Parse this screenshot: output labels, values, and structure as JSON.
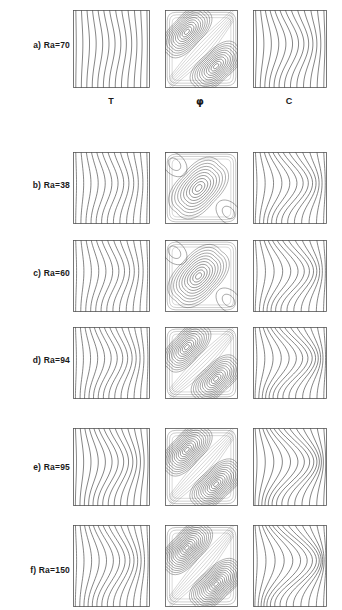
{
  "figure": {
    "width": 342,
    "height": 610,
    "line_color": "#3a3a3a",
    "frame_color": "#555555",
    "background": "#ffffff"
  },
  "columns": [
    {
      "key": "T",
      "label": "T",
      "name": "temperature",
      "x": 73,
      "width": 77,
      "header_center": 111
    },
    {
      "key": "PHI",
      "label": "φ",
      "name": "streamfunction",
      "x": 165,
      "width": 73,
      "header_center": 200
    },
    {
      "key": "C",
      "label": "C",
      "name": "concentration",
      "x": 253,
      "width": 74,
      "header_center": 289
    }
  ],
  "column_headers_y": 96,
  "rows": [
    {
      "id": "a",
      "label": "a) Ra=70",
      "ra": 70,
      "y": 10,
      "height": 78,
      "label_y": 40,
      "T": {
        "n": 13,
        "amp": 0.03,
        "phase": 1,
        "mode": 1
      },
      "PHI": {
        "cells": 2,
        "levels": 11,
        "tilt": 1,
        "strength": 0.88,
        "shaded": true
      },
      "C": {
        "n": 13,
        "amp": 0.075,
        "phase": 1,
        "mode": 1
      }
    },
    {
      "id": "b",
      "label": "b) Ra=38",
      "ra": 38,
      "y": 152,
      "height": 72,
      "label_y": 180,
      "T": {
        "n": 13,
        "amp": 0.055,
        "phase": 1,
        "mode": 1
      },
      "PHI": {
        "cells": 1,
        "levels": 10,
        "tilt": 1,
        "strength": 0.55,
        "shaded": false
      },
      "C": {
        "n": 13,
        "amp": 0.115,
        "phase": 1,
        "mode": 1
      }
    },
    {
      "id": "c",
      "label": "c) Ra=60",
      "ra": 60,
      "y": 240,
      "height": 72,
      "label_y": 268,
      "T": {
        "n": 13,
        "amp": 0.062,
        "phase": 1,
        "mode": 1
      },
      "PHI": {
        "cells": 1,
        "levels": 11,
        "tilt": 1,
        "strength": 0.65,
        "shaded": false
      },
      "C": {
        "n": 13,
        "amp": 0.125,
        "phase": 1,
        "mode": 1
      }
    },
    {
      "id": "d",
      "label": "d) Ra=94",
      "ra": 94,
      "y": 327,
      "height": 72,
      "label_y": 355,
      "T": {
        "n": 14,
        "amp": 0.072,
        "phase": 1,
        "mode": 1
      },
      "PHI": {
        "cells": 2,
        "levels": 11,
        "tilt": 1,
        "strength": 0.75,
        "shaded": true
      },
      "C": {
        "n": 14,
        "amp": 0.135,
        "phase": 1,
        "mode": 1
      }
    },
    {
      "id": "e",
      "label": "e) Ra=95",
      "ra": 95,
      "y": 428,
      "height": 78,
      "label_y": 462,
      "T": {
        "n": 14,
        "amp": 0.08,
        "phase": 1,
        "mode": 1
      },
      "PHI": {
        "cells": 2,
        "levels": 12,
        "tilt": 1,
        "strength": 0.92,
        "shaded": true
      },
      "C": {
        "n": 14,
        "amp": 0.15,
        "phase": 1,
        "mode": 1
      }
    },
    {
      "id": "f",
      "label": "f) Ra=150",
      "ra": 150,
      "y": 525,
      "height": 82,
      "label_y": 565,
      "T": {
        "n": 14,
        "amp": 0.092,
        "phase": 1,
        "mode": 1
      },
      "PHI": {
        "cells": 2,
        "levels": 13,
        "tilt": 1,
        "strength": 1.0,
        "shaded": true
      },
      "C": {
        "n": 14,
        "amp": 0.175,
        "phase": 1,
        "mode": 1
      }
    }
  ],
  "chart_data": {
    "type": "contour_grid",
    "xlabel": "",
    "ylabel": "",
    "grid": false,
    "legend": "none",
    "row_variable": "Ra",
    "row_values": [
      70,
      38,
      60,
      94,
      95,
      150
    ],
    "row_labels": [
      "a) Ra=70",
      "b) Ra=38",
      "c) Ra=60",
      "d) Ra=94",
      "e) Ra=95",
      "f) Ra=150"
    ],
    "column_variables": [
      "T",
      "φ",
      "C"
    ],
    "column_labels": [
      "T",
      "φ",
      "C"
    ],
    "series": [
      {
        "name": "T",
        "description": "Near-vertical isotherms; waviness increases with Ra",
        "contour_count": [
          13,
          13,
          13,
          14,
          14,
          14
        ],
        "distortion_amplitude": [
          0.03,
          0.055,
          0.062,
          0.072,
          0.08,
          0.092
        ]
      },
      {
        "name": "φ",
        "description": "Streamfunction cells along the main diagonal; single cell at low Ra, two counter-rotating cells at high Ra",
        "cell_count": [
          2,
          1,
          1,
          2,
          2,
          2
        ],
        "contour_levels": [
          11,
          10,
          11,
          11,
          12,
          13
        ],
        "relative_strength": [
          0.88,
          0.55,
          0.65,
          0.75,
          0.92,
          1.0
        ]
      },
      {
        "name": "C",
        "description": "Iso-concentration lines, strongly wavy with S-shaped bends that intensify with Ra",
        "contour_count": [
          13,
          13,
          13,
          14,
          14,
          14
        ],
        "distortion_amplitude": [
          0.075,
          0.115,
          0.125,
          0.135,
          0.15,
          0.175
        ]
      }
    ]
  }
}
